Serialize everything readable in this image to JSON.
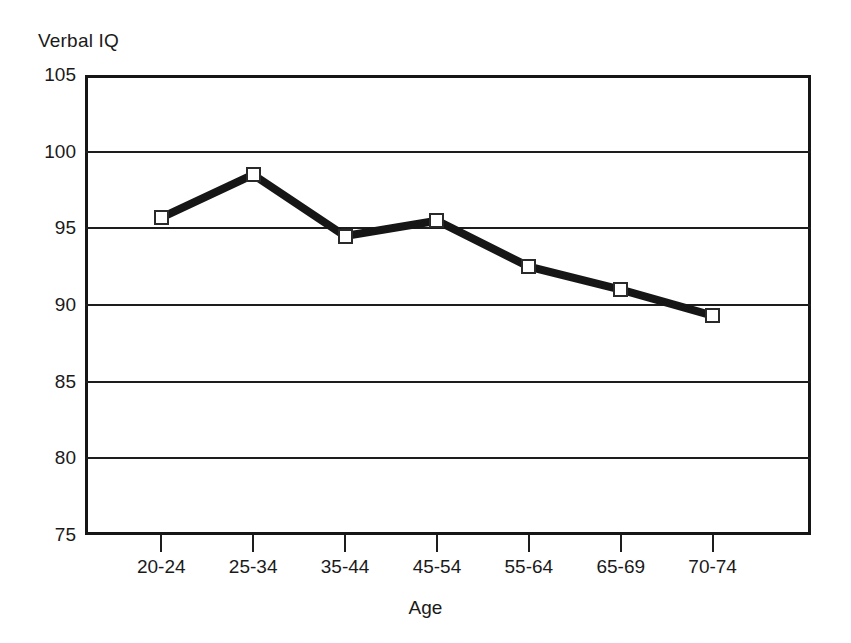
{
  "chart_data": {
    "type": "line",
    "title": "",
    "xlabel": "Age",
    "ylabel": "Verbal IQ",
    "categories": [
      "20-24",
      "25-34",
      "35-44",
      "45-54",
      "55-64",
      "65-69",
      "70-74"
    ],
    "values": [
      95.7,
      98.5,
      94.5,
      95.5,
      92.5,
      91.0,
      89.3
    ],
    "series": [
      {
        "name": "Verbal IQ",
        "values": [
          95.7,
          98.5,
          94.5,
          95.5,
          92.5,
          91.0,
          89.3
        ]
      }
    ],
    "ylim": [
      75,
      105
    ],
    "yticks": [
      105,
      100,
      95,
      90,
      85,
      80,
      75
    ],
    "ytick_labels": [
      "105",
      "100",
      "95",
      "90",
      "85",
      "80",
      "75"
    ],
    "grid": true,
    "legend": "none",
    "marker": "open-square",
    "line_color": "#161616",
    "marker_fill": "#ffffff",
    "marker_edge": "#2a2a2a"
  }
}
